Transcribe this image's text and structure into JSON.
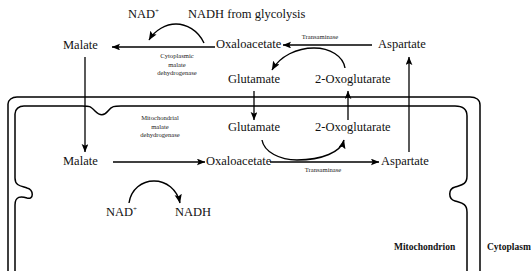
{
  "diagram": {
    "compartments": {
      "mitochondrion": "Mitochondrion",
      "cytoplasm": "Cytoplasm"
    },
    "cytosolic": {
      "malate": "Malate",
      "oxaloacetate": "Oxaloacetate",
      "aspartate": "Aspartate",
      "glutamate": "Glutamate",
      "oxoglutarate": "2-Oxoglutarate",
      "nad": "NAD",
      "nad_charge": "+",
      "nadh_source": "NADH from glycolysis",
      "enzyme_mdh": "Cytoplasmic\nmalate\ndehydrogenase",
      "enzyme_mdh_l1": "Cytoplasmic",
      "enzyme_mdh_l2": "malate",
      "enzyme_mdh_l3": "dehydrogenase",
      "enzyme_transaminase": "Transaminase"
    },
    "mitochondrial": {
      "malate": "Malate",
      "oxaloacetate": "Oxaloacetate",
      "aspartate": "Aspartate",
      "glutamate": "Glutamate",
      "oxoglutarate": "2-Oxoglutarate",
      "nad": "NAD",
      "nad_charge": "+",
      "nadh": "NADH",
      "enzyme_mdh_l1": "Mitochondrial",
      "enzyme_mdh_l2": "malate",
      "enzyme_mdh_l3": "dehydrogenase",
      "enzyme_transaminase": "Transaminase"
    },
    "colors": {
      "stroke": "#000000",
      "background": "#ffffff",
      "text": "#111111"
    }
  }
}
